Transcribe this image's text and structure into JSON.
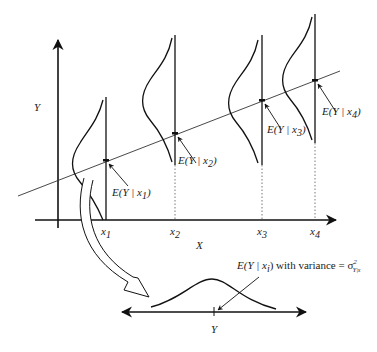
{
  "diagram": {
    "type": "regression-conditional-distributions",
    "axes": {
      "y_label": "Y",
      "x_label": "X",
      "x_ticks": [
        {
          "name": "x",
          "sub": "1"
        },
        {
          "name": "x",
          "sub": "2"
        },
        {
          "name": "x",
          "sub": "3"
        },
        {
          "name": "x",
          "sub": "4"
        }
      ]
    },
    "conditional_means": [
      {
        "prefix": "E(Y | ",
        "var": "x",
        "sub": "1",
        "suffix": ")"
      },
      {
        "prefix": "E(Y | ",
        "var": "x",
        "sub": "2",
        "suffix": ")"
      },
      {
        "prefix": "E(Y | ",
        "var": "x",
        "sub": "3",
        "suffix": ")"
      },
      {
        "prefix": "E(Y | ",
        "var": "x",
        "sub": "4",
        "suffix": ")"
      }
    ],
    "inset": {
      "annotation_prefix": "E(Y | ",
      "annotation_var": "x",
      "annotation_sub": "i",
      "annotation_mid": ") with variance = ",
      "sigma": "σ",
      "sigma_sup": "2",
      "sigma_sub": "Y|x",
      "axis_label": "Y"
    }
  }
}
